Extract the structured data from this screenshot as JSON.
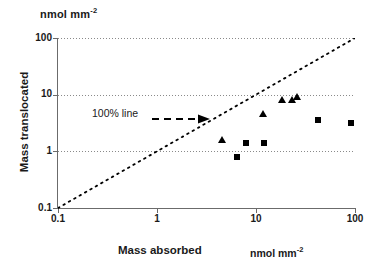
{
  "figure": {
    "unit_top": "nmol mm",
    "unit_top_exp": "-2",
    "unit_bottom": "nmol mm",
    "unit_bottom_exp": "-2",
    "annotation": "100% line"
  },
  "chart_data": {
    "type": "scatter",
    "title": "",
    "xlabel": "Mass absorbed",
    "ylabel": "Mass translocated",
    "xunit": "nmol mm-2",
    "yunit": "nmol mm-2",
    "xscale": "log",
    "yscale": "log",
    "xlim": [
      0.1,
      100
    ],
    "ylim": [
      0.1,
      100
    ],
    "xticks": [
      "0.1",
      "1",
      "10",
      "100"
    ],
    "yticks": [
      "0.1",
      "1",
      "10",
      "100"
    ],
    "xtick_values": [
      0.1,
      1,
      10,
      100
    ],
    "ytick_values": [
      0.1,
      1,
      10,
      100
    ],
    "grid": "horizontal dotted gridlines at y = 1, 10, 100",
    "legend": "none",
    "annotations": [
      {
        "text": "100% line",
        "x": 0.9,
        "y": 4.5,
        "arrow": "dashed arrow pointing right toward the 1:1 diagonal"
      }
    ],
    "reference_line": {
      "name": "100% line",
      "style": "dotted",
      "from": [
        0.1,
        0.1
      ],
      "to": [
        100,
        100
      ],
      "description": "1:1 diagonal where mass translocated equals mass absorbed"
    },
    "series": [
      {
        "name": "triangles",
        "marker": "triangle",
        "color": "#000000",
        "points": [
          {
            "x": 4.5,
            "y": 1.6
          },
          {
            "x": 11.8,
            "y": 4.6
          },
          {
            "x": 18.5,
            "y": 8.0
          },
          {
            "x": 23.0,
            "y": 8.0
          },
          {
            "x": 26.0,
            "y": 9.2
          }
        ]
      },
      {
        "name": "squares",
        "marker": "square",
        "color": "#000000",
        "points": [
          {
            "x": 6.5,
            "y": 0.8
          },
          {
            "x": 8.0,
            "y": 1.4
          },
          {
            "x": 12.0,
            "y": 1.4
          },
          {
            "x": 42.0,
            "y": 3.6
          },
          {
            "x": 92.0,
            "y": 3.2
          }
        ]
      }
    ]
  }
}
